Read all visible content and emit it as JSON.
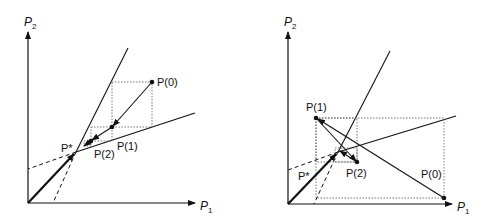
{
  "figure": {
    "panels": [
      {
        "id": "left",
        "description": "Monotone convergence of price adjustment to equilibrium P*",
        "axes": {
          "x_label": "P",
          "x_sub": "1",
          "y_label": "P",
          "y_sub": "2"
        },
        "points": {
          "P0": "P(0)",
          "P1": "P(1)",
          "P2": "P(2)",
          "Pstar": "P*"
        }
      },
      {
        "id": "right",
        "description": "Oscillating convergence of price adjustment to equilibrium P*",
        "axes": {
          "x_label": "P",
          "x_sub": "1",
          "y_label": "P",
          "y_sub": "2"
        },
        "points": {
          "P0": "P(0)",
          "P1": "P(1)",
          "P2": "P(2)",
          "Pstar": "P*"
        }
      }
    ],
    "colors": {
      "ink": "#111111",
      "dotted": "#555555",
      "background": "#ffffff"
    }
  }
}
